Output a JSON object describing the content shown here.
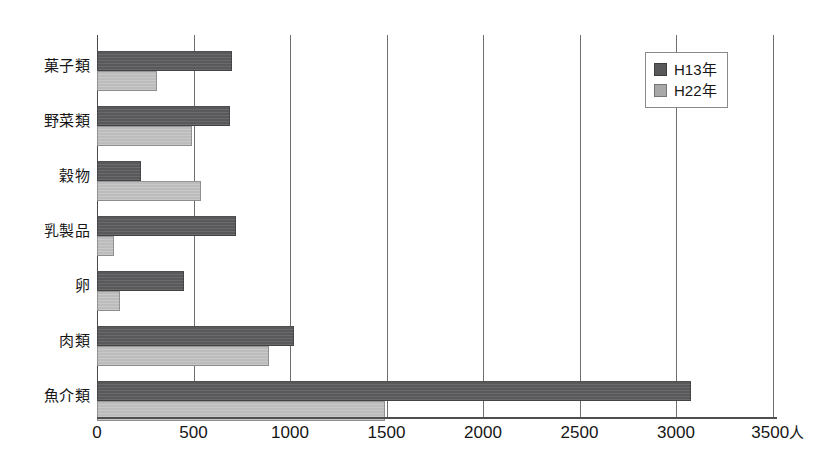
{
  "chart_data": {
    "type": "bar",
    "orientation": "horizontal",
    "title": "",
    "xlabel": "",
    "ylabel": "",
    "unit_label": "人",
    "xlim": [
      0,
      3500
    ],
    "xticks": [
      0,
      500,
      1000,
      1500,
      2000,
      2500,
      3000,
      3500
    ],
    "xtick_labels": [
      "0",
      "500",
      "1000",
      "1500",
      "2000",
      "2500",
      "3000",
      "3500"
    ],
    "grid": true,
    "grid_axis": "x",
    "legend_position": "upper-right",
    "categories": [
      "菓子類",
      "野菜類",
      "穀物",
      "乳製品",
      "卵",
      "肉類",
      "魚介類"
    ],
    "series": [
      {
        "name": "H13年",
        "color": "#59595b",
        "values": [
          700,
          690,
          230,
          720,
          450,
          1020,
          3080
        ]
      },
      {
        "name": "H22年",
        "color": "#bcbcbc",
        "values": [
          310,
          490,
          540,
          90,
          120,
          890,
          1490
        ]
      }
    ]
  },
  "legend": {
    "entries": [
      {
        "label": "H13年",
        "swatch": "dark-gray-swatch-icon"
      },
      {
        "label": "H22年",
        "swatch": "light-gray-swatch-icon"
      }
    ]
  },
  "axis": {
    "unit_suffix": "人"
  }
}
